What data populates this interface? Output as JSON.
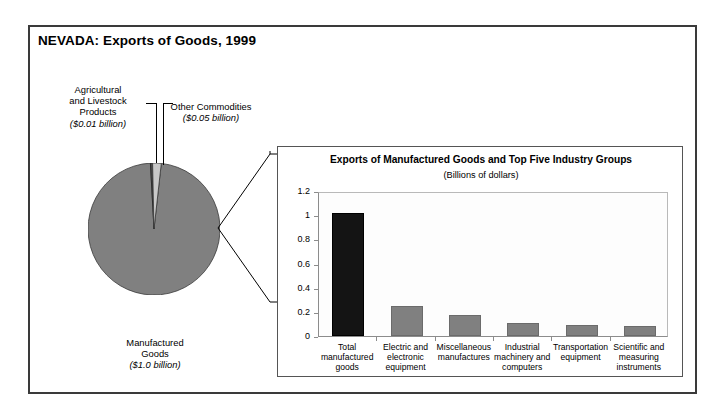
{
  "figure": {
    "title": "NEVADA: Exports of Goods, 1999"
  },
  "pie_labels": {
    "agricultural": {
      "name": "Agricultural and Livestock Products",
      "line1": "Agricultural",
      "line2": "and Livestock",
      "line3": "Products",
      "value": "($0.01 billion)"
    },
    "other": {
      "name": "Other Commodities",
      "line1": "Other Commodities",
      "value": "($0.05 billion)"
    },
    "manufactured": {
      "name": "Manufactured Goods",
      "line1": "Manufactured",
      "line2": "Goods",
      "value": "($1.0 billion)"
    }
  },
  "inset": {
    "title": "Exports of Manufactured Goods and Top Five Industry Groups",
    "subtitle": "(Billions of dollars)"
  },
  "chart_data": [
    {
      "type": "pie",
      "title": "NEVADA: Exports of Goods, 1999",
      "unit": "Billions of dollars",
      "labels": [
        "Manufactured Goods",
        "Agricultural and Livestock Products",
        "Other Commodities"
      ],
      "values": [
        1.0,
        0.01,
        0.05
      ],
      "value_labels": [
        "($1.0 billion)",
        "($0.01 billion)",
        "($0.05 billion)"
      ],
      "colors": [
        "#808080",
        "#4d4d4d",
        "#c8c8c8"
      ],
      "legend": "none",
      "start_angle_deg": 0,
      "direction": "clockwise"
    },
    {
      "type": "bar",
      "title": "Exports of Manufactured Goods and Top Five Industry Groups",
      "subtitle": "(Billions of dollars)",
      "xlabel": "",
      "ylabel": "",
      "ylim": [
        0,
        1.2
      ],
      "yticks": [
        0,
        0.2,
        0.4,
        0.6,
        0.8,
        1,
        1.2
      ],
      "ytick_labels": [
        "0",
        "0.2",
        "0.4",
        "0.6",
        "0.8",
        "1",
        "1.2"
      ],
      "grid": false,
      "categories": [
        "Total manufactured goods",
        "Electric and electronic equipment",
        "Miscellaneous manufactures",
        "Industrial machinery and computers",
        "Transportation equipment",
        "Scientific and measuring instruments"
      ],
      "category_lines": [
        [
          "Total",
          "manufactured",
          "goods"
        ],
        [
          "Electric and",
          "electronic",
          "equipment"
        ],
        [
          "Miscellaneous",
          "manufactures"
        ],
        [
          "Industrial",
          "machinery and",
          "computers"
        ],
        [
          "Transportation",
          "equipment"
        ],
        [
          "Scientific and",
          "measuring",
          "instruments"
        ]
      ],
      "values": [
        1.02,
        0.25,
        0.17,
        0.105,
        0.09,
        0.08
      ],
      "bar_colors": [
        "#141414",
        "#808080",
        "#808080",
        "#808080",
        "#808080",
        "#808080"
      ]
    }
  ]
}
